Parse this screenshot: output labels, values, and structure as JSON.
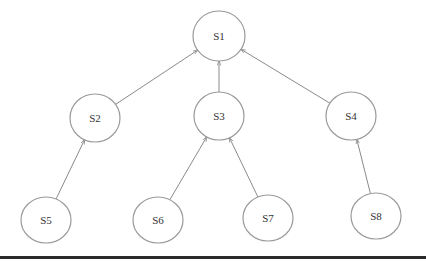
{
  "diagram": {
    "type": "tree",
    "direction": "child-to-parent arrows",
    "nodes": [
      {
        "id": "S1",
        "label": "S1",
        "cx": 219,
        "cy": 36,
        "rx": 26,
        "ry": 25
      },
      {
        "id": "S2",
        "label": "S2",
        "cx": 95,
        "cy": 118,
        "rx": 25,
        "ry": 24
      },
      {
        "id": "S3",
        "label": "S3",
        "cx": 219,
        "cy": 116,
        "rx": 25,
        "ry": 24
      },
      {
        "id": "S4",
        "label": "S4",
        "cx": 351,
        "cy": 116,
        "rx": 25,
        "ry": 24
      },
      {
        "id": "S5",
        "label": "S5",
        "cx": 46,
        "cy": 220,
        "rx": 25,
        "ry": 23
      },
      {
        "id": "S6",
        "label": "S6",
        "cx": 158,
        "cy": 220,
        "rx": 25,
        "ry": 23
      },
      {
        "id": "S7",
        "label": "S7",
        "cx": 268,
        "cy": 218,
        "rx": 25,
        "ry": 23
      },
      {
        "id": "S8",
        "label": "S8",
        "cx": 376,
        "cy": 216,
        "rx": 25,
        "ry": 23
      }
    ],
    "edges": [
      {
        "from": "S2",
        "to": "S1"
      },
      {
        "from": "S3",
        "to": "S1"
      },
      {
        "from": "S4",
        "to": "S1"
      },
      {
        "from": "S5",
        "to": "S2"
      },
      {
        "from": "S6",
        "to": "S3"
      },
      {
        "from": "S7",
        "to": "S3"
      },
      {
        "from": "S8",
        "to": "S4"
      }
    ],
    "colors": {
      "edge": "#8a8a8a",
      "node_stroke": "#9a9a9a",
      "text": "#333333",
      "baseline": "#2a2a2a"
    }
  }
}
